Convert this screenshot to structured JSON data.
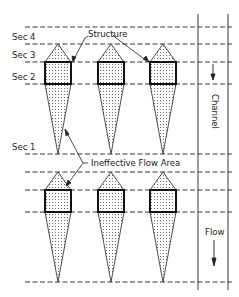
{
  "diagram": {
    "section_labels": [
      {
        "id": "sec4",
        "text": "Sec 4"
      },
      {
        "id": "sec3",
        "text": "Sec 3"
      },
      {
        "id": "sec2",
        "text": "Sec 2"
      },
      {
        "id": "sec1",
        "text": "Sec 1"
      }
    ],
    "callouts": {
      "structure": "Structure",
      "ineffective_flow_area": "Ineffective Flow Area"
    },
    "channel_label": "Channel",
    "flow_label": "Flow",
    "colors": {
      "line": "#222222",
      "fill_dots": "#555555",
      "background": "#ffffff"
    },
    "layout": {
      "rows_of_structures": 2,
      "structures_per_row": 3,
      "cross_section_lines_per_row": 4
    }
  }
}
